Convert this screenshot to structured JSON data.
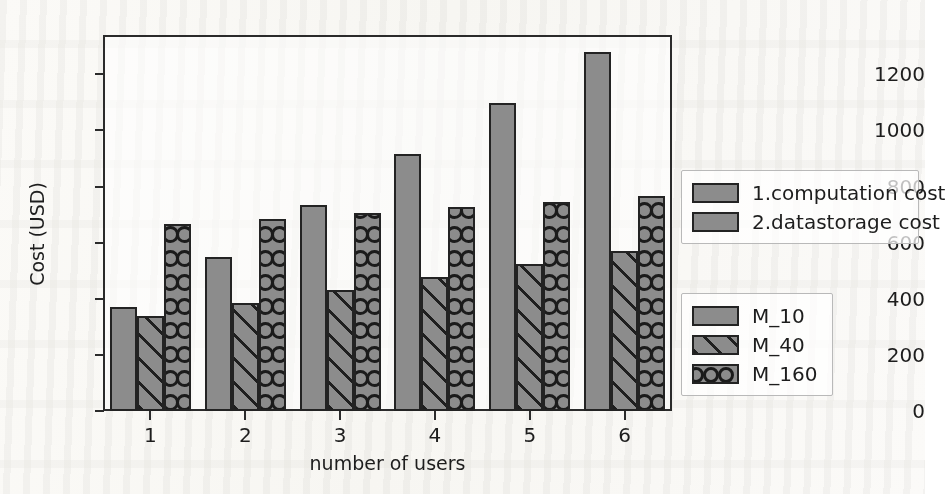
{
  "chart_data": {
    "type": "bar",
    "title": "",
    "xlabel": "number of users",
    "ylabel": "Cost (USD)",
    "categories": [
      "1",
      "2",
      "3",
      "4",
      "5",
      "6"
    ],
    "xticklabels": [
      "1",
      "2",
      "3",
      "4",
      "5",
      "6"
    ],
    "yticklabels": [
      "0",
      "200",
      "400",
      "600",
      "800",
      "1000",
      "1200"
    ],
    "yticks": [
      0,
      200,
      400,
      600,
      800,
      1000,
      1200
    ],
    "ylim": [
      0,
      1340
    ],
    "grid": false,
    "legend_position": "right",
    "series": [
      {
        "name": "M_10",
        "pattern": "solid",
        "values": [
          370,
          548,
          733,
          915,
          1097,
          1278
        ]
      },
      {
        "name": "M_40",
        "pattern": "diagonal-hatch",
        "values": [
          338,
          384,
          430,
          478,
          525,
          570
        ]
      },
      {
        "name": "M_160",
        "pattern": "circles",
        "values": [
          667,
          686,
          706,
          726,
          745,
          766
        ]
      }
    ],
    "cost_legend": [
      {
        "label": "1.computation cost",
        "pattern": "solid"
      },
      {
        "label": "2.datastorage cost",
        "pattern": "solid"
      }
    ],
    "colors": {
      "bar_fill": "#8c8c8c",
      "bar_edge": "#232323",
      "axis": "#2b2b2b",
      "text": "#1d1d1d",
      "legend_border": "#b9b9b9",
      "background": "#ffffff"
    }
  },
  "legend_cost": {
    "items": [
      {
        "label": "1.computation cost"
      },
      {
        "label": "2.datastorage cost"
      }
    ]
  },
  "legend_models": {
    "items": [
      {
        "label": "M_10"
      },
      {
        "label": "M_40"
      },
      {
        "label": "M_160"
      }
    ]
  },
  "axes": {
    "y_title": "Cost (USD)",
    "x_title": "number of users",
    "y_ticks": [
      "1200",
      "1000",
      "800",
      "600",
      "400",
      "200",
      "0"
    ],
    "x_ticks": [
      "1",
      "2",
      "3",
      "4",
      "5",
      "6"
    ]
  }
}
